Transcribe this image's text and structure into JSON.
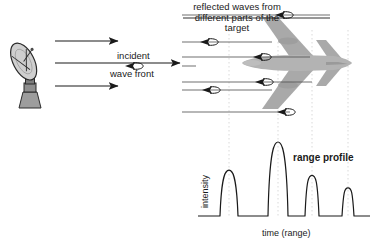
{
  "figure": {
    "title_caption": [
      "reflected waves from",
      "different parts of the",
      "target"
    ],
    "incident_label_top": "incident",
    "incident_label_bottom": "wave front",
    "range_profile_label": "range profile"
  },
  "icons": {
    "radar": "radar-antenna-icon",
    "aircraft": "aircraft-topview-icon"
  },
  "colors": {
    "stroke": "#1a1a1a",
    "aircraft_fill": "#a9a9a9",
    "aircraft_fill_light": "#bdbdbd",
    "radar_fill": "#c9c9c9",
    "guide": "#cfcfcf",
    "background": "#ffffff"
  },
  "incident_arrows": [
    {
      "name": "incident-arrow-top",
      "y": 41,
      "x1": 55,
      "x2": 118
    },
    {
      "name": "incident-arrow-middle",
      "y": 63,
      "x1": 55,
      "x2": 180
    },
    {
      "name": "incident-arrow-bottom",
      "y": 86,
      "x1": 55,
      "x2": 118
    }
  ],
  "reflected_arrows": [
    {
      "name": "reflected-arrow-1",
      "y": 15,
      "x_tail": 330,
      "x_head": 282
    },
    {
      "name": "reflected-arrow-2",
      "y": 42,
      "x_tail": 272,
      "x_head": 207
    },
    {
      "name": "reflected-arrow-3",
      "y": 57,
      "x_tail": 310,
      "x_head": 260
    },
    {
      "name": "reflected-arrow-4",
      "y": 66,
      "x_tail": 196,
      "x_head": 132
    },
    {
      "name": "reflected-arrow-5",
      "y": 82,
      "x_tail": 312,
      "x_head": 262
    },
    {
      "name": "reflected-arrow-6",
      "y": 90,
      "x_tail": 272,
      "x_head": 209
    },
    {
      "name": "reflected-arrow-7",
      "y": 112,
      "x_tail": 290,
      "x_head": 284
    }
  ],
  "chart_data": {
    "type": "line",
    "title": "range profile",
    "xlabel": "time (range)",
    "ylabel": "intensity",
    "grid": false,
    "legend": null,
    "axis": {
      "x_min": 198,
      "x_max": 370,
      "baseline_y": 216,
      "top_y": 142
    },
    "peaks": [
      {
        "name": "peak-1",
        "center": 229,
        "half_width": 9,
        "height": 0.62
      },
      {
        "name": "peak-2",
        "center": 278,
        "half_width": 10,
        "height": 1.0
      },
      {
        "name": "peak-3",
        "center": 312,
        "half_width": 7,
        "height": 0.55
      },
      {
        "name": "peak-4",
        "center": 348,
        "half_width": 6,
        "height": 0.38
      }
    ],
    "guide_lines_x": [
      229,
      278,
      312,
      348
    ],
    "values": [
      0.62,
      1.0,
      0.55,
      0.38
    ],
    "categories": [
      "nose",
      "fuselage/wing",
      "engine/body",
      "tail"
    ],
    "ylim": [
      0,
      1
    ]
  }
}
